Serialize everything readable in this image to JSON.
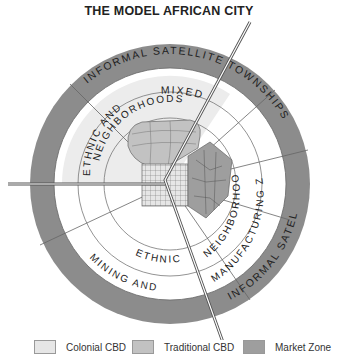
{
  "title": "THE MODEL AFRICAN CITY",
  "zones": {
    "outer_ring": "INFORMAL SATELLITE TOWNSHIPS",
    "mixed": "MIXED",
    "ethnic_and": "ETHNIC AND",
    "neighborhoods_upper": "NEIGHBORHOODS",
    "ethnic_lower": "ETHNIC",
    "neighborhoods_right": "NEIGHBORHOODS",
    "mining_and": "MINING AND",
    "manufacturing_zone": "MANUFACTURING ZONE"
  },
  "legend": [
    {
      "label": "Colonial CBD",
      "color": "#e6e6e6"
    },
    {
      "label": "Traditional CBD",
      "color": "#c2c2c2"
    },
    {
      "label": "Market Zone",
      "color": "#9e9e9e"
    }
  ],
  "colors": {
    "outer_ring": "#8c8c8c",
    "mixed_sector": "#ececec",
    "line": "#666666"
  }
}
